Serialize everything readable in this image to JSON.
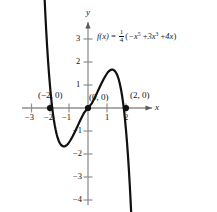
{
  "chart_data": {
    "type": "line",
    "title": "",
    "equation_text": "f(x) = 1/4(-x^5 + 3x^3 + 4x)",
    "function_name": "f(x)",
    "equals": "=",
    "coefficient_numerator": "1",
    "coefficient_denominator": "4",
    "expression_open": "(",
    "term1_base": "−x",
    "term1_exp": "5",
    "term2_sign": "+",
    "term2_base": "3x",
    "term2_exp": "3",
    "term3_sign": "+",
    "term3_base": "4x",
    "expression_close": ")",
    "xlabel": "x",
    "ylabel": "y",
    "xlim": [
      -3.6,
      3.4
    ],
    "ylim": [
      -4.8,
      3.9
    ],
    "grid": false,
    "legend": "none",
    "x_ticks": [
      -3,
      -2,
      -1,
      1,
      2
    ],
    "x_tick_labels": [
      "−3",
      "−2",
      "−1",
      "1",
      "2"
    ],
    "y_ticks": [
      3,
      2,
      1,
      -1,
      -2,
      -3,
      -4
    ],
    "y_tick_labels": [
      "3",
      "2",
      "1",
      "−1",
      "−2",
      "−3",
      "−4"
    ],
    "annotations": [
      {
        "label": "(−2, 0)",
        "x": -2,
        "y": 0
      },
      {
        "label": "(0, 0)",
        "x": 0,
        "y": 0
      },
      {
        "label": "(2, 0)",
        "x": 2,
        "y": 0
      }
    ],
    "marked_points": [
      {
        "x": -2,
        "y": 0
      },
      {
        "x": 0,
        "y": 0
      },
      {
        "x": 2,
        "y": 0
      }
    ],
    "x": [
      -2.35,
      -2.3,
      -2.25,
      -2.2,
      -2.15,
      -2.1,
      -2.05,
      -2.0,
      -1.95,
      -1.9,
      -1.85,
      -1.8,
      -1.75,
      -1.7,
      -1.65,
      -1.6,
      -1.55,
      -1.5,
      -1.45,
      -1.4,
      -1.35,
      -1.3,
      -1.25,
      -1.2,
      -1.15,
      -1.1,
      -1.05,
      -1.0,
      -0.9,
      -0.8,
      -0.7,
      -0.6,
      -0.5,
      -0.4,
      -0.3,
      -0.2,
      -0.1,
      0.0,
      0.1,
      0.2,
      0.3,
      0.4,
      0.5,
      0.6,
      0.7,
      0.8,
      0.9,
      1.0,
      1.05,
      1.1,
      1.15,
      1.2,
      1.25,
      1.3,
      1.35,
      1.4,
      1.45,
      1.5,
      1.55,
      1.6,
      1.65,
      1.7,
      1.75,
      1.8,
      1.85,
      1.9,
      1.95,
      2.0,
      2.05,
      2.1,
      2.15,
      2.2,
      2.25,
      2.3,
      2.35
    ],
    "y": [
      5.99,
      5.03,
      4.16,
      3.37,
      2.66,
      2.03,
      1.46,
      0.96,
      0.52,
      0.13,
      -0.21,
      -0.5,
      -0.75,
      -0.96,
      -1.14,
      -1.29,
      -1.41,
      -1.5,
      -1.57,
      -1.62,
      -1.65,
      -1.67,
      -1.67,
      -1.66,
      -1.63,
      -1.6,
      -1.56,
      -1.5,
      -1.37,
      -1.22,
      -1.05,
      -0.88,
      -0.7,
      -0.52,
      -0.36,
      -0.2,
      -0.1,
      0.0,
      0.1,
      0.2,
      0.36,
      0.52,
      0.7,
      0.88,
      1.05,
      1.22,
      1.37,
      1.5,
      1.56,
      1.6,
      1.63,
      1.66,
      1.67,
      1.67,
      1.65,
      1.62,
      1.57,
      1.5,
      1.41,
      1.29,
      1.14,
      0.96,
      0.75,
      0.5,
      0.21,
      -0.13,
      -0.52,
      -0.96,
      -1.46,
      -2.03,
      -2.66,
      -3.37,
      -4.16,
      -5.03,
      -5.99
    ],
    "local_max": {
      "x": 1.3,
      "y": 2.1
    },
    "local_min": {
      "x": -1.3,
      "y": -2.1
    },
    "curve_color": "#101010",
    "axis_color": "#8a8a8a"
  }
}
